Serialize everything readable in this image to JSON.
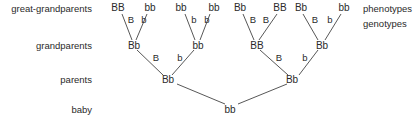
{
  "rows": {
    "great_grandparents": "great-grandparents",
    "grandparents": "grandparents",
    "parents": "parents",
    "baby": "baby"
  },
  "legend": {
    "phenotypes": "phenotypes",
    "genotypes": "genotypes"
  },
  "great_grandparents": [
    "BB",
    "bb",
    "bb",
    "bb",
    "Bb",
    "BB",
    "Bb",
    "bb"
  ],
  "gg_alleles": [
    "B",
    "b",
    "b",
    "b",
    "B",
    "B",
    "B",
    "b"
  ],
  "grandparents": [
    "Bb",
    "bb",
    "BB",
    "Bb"
  ],
  "gp_alleles": [
    "B",
    "b",
    "B",
    "b"
  ],
  "parents": [
    "Bb",
    "Bb"
  ],
  "baby": "bb"
}
